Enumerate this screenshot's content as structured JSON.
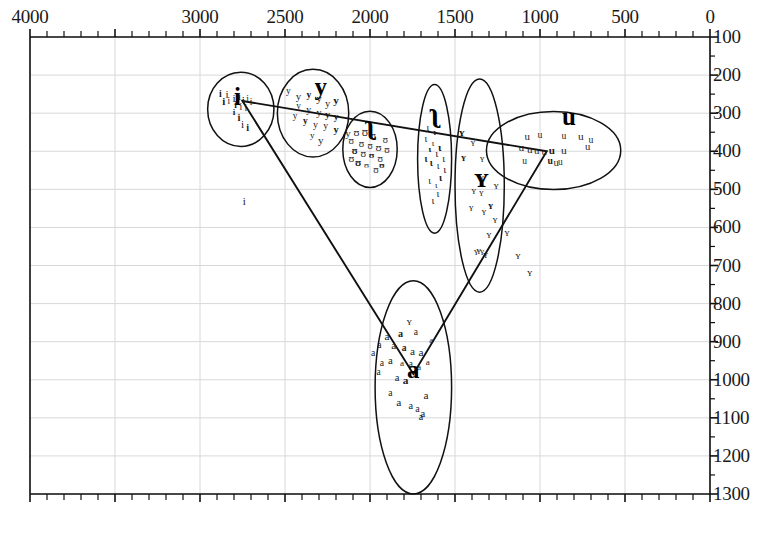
{
  "figure": {
    "kind": "vowel-formant-scatter",
    "background": "#ffffff",
    "ink": "#111111",
    "gridline_color": "#d8d8dc"
  },
  "axes": {
    "top": {
      "name": "F2 (Hz)",
      "orientation": "horizontal-reversed",
      "range_left": 4000,
      "range_right": 0,
      "labels": [
        "4000",
        "3000",
        "2500",
        "2000",
        "1500",
        "1000",
        "500",
        "0"
      ],
      "label_values": [
        4000,
        3000,
        2500,
        2000,
        1500,
        1000,
        500,
        0
      ],
      "minor_tick_step": 100
    },
    "right": {
      "name": "F1 (Hz)",
      "orientation": "vertical-down",
      "range_top": 100,
      "range_bottom": 1300,
      "labels": [
        "100",
        "200",
        "300",
        "400",
        "500",
        "600",
        "700",
        "800",
        "900",
        "1000",
        "1100",
        "1200",
        "1300"
      ],
      "label_values": [
        100,
        200,
        300,
        400,
        500,
        600,
        700,
        800,
        900,
        1000,
        1100,
        1200,
        1300
      ],
      "minor_tick_step": 50
    }
  },
  "chart_data": {
    "type": "scatter",
    "title": "",
    "xlabel": "F2 (Hz)",
    "ylabel": "F1 (Hz)",
    "xlim": [
      4000,
      0
    ],
    "ylim": [
      1300,
      100
    ],
    "x_reversed": true,
    "y_reversed": true,
    "grid": true,
    "legend": "none",
    "annotations": [
      {
        "label": "i",
        "x": 2780,
        "y": 258
      },
      {
        "label": "y",
        "x": 2290,
        "y": 230
      },
      {
        "label": "ʉ",
        "x": 2000,
        "y": 330
      },
      {
        "label": "ɪ",
        "x": 1620,
        "y": 300
      },
      {
        "label": "ʏ",
        "x": 1345,
        "y": 470
      },
      {
        "label": "u",
        "x": 830,
        "y": 310
      },
      {
        "label": "a",
        "x": 1745,
        "y": 975
      }
    ],
    "clusters": [
      {
        "name": "i",
        "shape": "ellipse",
        "center_x": 2760,
        "center_y": 290,
        "width_hz": 390,
        "height_hz": 195,
        "rotation_deg": 0,
        "points": [
          [
            2880,
            250
          ],
          [
            2840,
            252
          ],
          [
            2800,
            262
          ],
          [
            2770,
            258
          ],
          [
            2745,
            268
          ],
          [
            2720,
            262
          ],
          [
            2700,
            272
          ],
          [
            2790,
            282
          ],
          [
            2760,
            285
          ],
          [
            2730,
            290
          ],
          [
            2800,
            300
          ],
          [
            2770,
            312
          ],
          [
            2750,
            330
          ],
          [
            2720,
            340
          ],
          [
            2830,
            270
          ],
          [
            2860,
            268
          ]
        ]
      },
      {
        "name": "y",
        "shape": "ellipse",
        "center_x": 2335,
        "center_y": 300,
        "width_hz": 420,
        "height_hz": 230,
        "rotation_deg": 0,
        "points": [
          [
            2480,
            245
          ],
          [
            2420,
            255
          ],
          [
            2360,
            252
          ],
          [
            2300,
            262
          ],
          [
            2250,
            275
          ],
          [
            2200,
            268
          ],
          [
            2420,
            285
          ],
          [
            2360,
            292
          ],
          [
            2300,
            298
          ],
          [
            2250,
            305
          ],
          [
            2200,
            312
          ],
          [
            2440,
            310
          ],
          [
            2380,
            322
          ],
          [
            2320,
            330
          ],
          [
            2260,
            335
          ],
          [
            2200,
            345
          ],
          [
            2340,
            360
          ],
          [
            2290,
            372
          ]
        ]
      },
      {
        "name": "ʉ",
        "shape": "ellipse",
        "center_x": 2000,
        "center_y": 395,
        "width_hz": 320,
        "height_hz": 200,
        "rotation_deg": 0,
        "points": [
          [
            2080,
            350
          ],
          [
            2030,
            352
          ],
          [
            1980,
            362
          ],
          [
            2110,
            372
          ],
          [
            2050,
            382
          ],
          [
            2000,
            388
          ],
          [
            1950,
            392
          ],
          [
            1900,
            398
          ],
          [
            2090,
            402
          ],
          [
            2040,
            408
          ],
          [
            1990,
            412
          ],
          [
            1940,
            420
          ],
          [
            2070,
            432
          ],
          [
            2020,
            440
          ],
          [
            1965,
            448
          ],
          [
            2110,
            420
          ],
          [
            1910,
            372
          ],
          [
            1930,
            440
          ]
        ]
      },
      {
        "name": "ɪ",
        "shape": "ellipse",
        "center_x": 1620,
        "center_y": 420,
        "width_hz": 200,
        "height_hz": 390,
        "rotation_deg": 0,
        "points": [
          [
            1660,
            340
          ],
          [
            1620,
            352
          ],
          [
            1672,
            368
          ],
          [
            1630,
            382
          ],
          [
            1590,
            392
          ],
          [
            1648,
            398
          ],
          [
            1608,
            408
          ],
          [
            1566,
            418
          ],
          [
            1640,
            430
          ],
          [
            1600,
            440
          ],
          [
            1560,
            448
          ],
          [
            1650,
            478
          ],
          [
            1610,
            490
          ],
          [
            1600,
            512
          ],
          [
            1630,
            530
          ],
          [
            1585,
            470
          ],
          [
            1670,
            420
          ]
        ]
      },
      {
        "name": "ʏ",
        "shape": "ellipse",
        "center_x": 1355,
        "center_y": 490,
        "width_hz": 290,
        "height_hz": 560,
        "rotation_deg": 0,
        "points": [
          [
            1460,
            352
          ],
          [
            1395,
            378
          ],
          [
            1340,
            420
          ],
          [
            1345,
            468
          ],
          [
            1390,
            505
          ],
          [
            1345,
            512
          ],
          [
            1290,
            545
          ],
          [
            1330,
            560
          ],
          [
            1405,
            548
          ],
          [
            1265,
            580
          ],
          [
            1450,
            420
          ],
          [
            1300,
            618
          ],
          [
            1360,
            662
          ],
          [
            1340,
            668
          ],
          [
            1320,
            672
          ],
          [
            1375,
            665
          ],
          [
            1258,
            488
          ]
        ]
      },
      {
        "name": "u",
        "shape": "ellipse",
        "center_x": 920,
        "center_y": 398,
        "width_hz": 790,
        "height_hz": 205,
        "rotation_deg": 0,
        "points": [
          [
            1075,
            360
          ],
          [
            1000,
            358
          ],
          [
            860,
            360
          ],
          [
            760,
            362
          ],
          [
            700,
            370
          ],
          [
            1110,
            392
          ],
          [
            1060,
            398
          ],
          [
            1020,
            398
          ],
          [
            975,
            402
          ],
          [
            930,
            400
          ],
          [
            860,
            400
          ],
          [
            720,
            388
          ],
          [
            940,
            425
          ],
          [
            905,
            430
          ],
          [
            880,
            432
          ],
          [
            1090,
            428
          ]
        ]
      },
      {
        "name": "a",
        "shape": "ellipse",
        "center_x": 1745,
        "center_y": 1020,
        "width_hz": 450,
        "height_hz": 560,
        "rotation_deg": 0,
        "points": [
          [
            1820,
            880
          ],
          [
            1730,
            878
          ],
          [
            1640,
            898
          ],
          [
            1900,
            888
          ],
          [
            1860,
            912
          ],
          [
            1800,
            918
          ],
          [
            1750,
            928
          ],
          [
            1700,
            930
          ],
          [
            1945,
            910
          ],
          [
            1880,
            948
          ],
          [
            1812,
            958
          ],
          [
            1760,
            962
          ],
          [
            1712,
            968
          ],
          [
            1660,
            955
          ],
          [
            1930,
            955
          ],
          [
            1982,
            930
          ],
          [
            1840,
            995
          ],
          [
            1790,
            1002
          ],
          [
            1880,
            1035
          ],
          [
            1830,
            1060
          ],
          [
            1760,
            1068
          ],
          [
            1720,
            1078
          ],
          [
            1690,
            1090
          ],
          [
            1700,
            1098
          ],
          [
            1670,
            1042
          ],
          [
            1950,
            982
          ]
        ]
      }
    ],
    "stray_points": [
      {
        "label": "i",
        "x": 2740,
        "y": 530
      },
      {
        "label": "ʏ",
        "x": 1195,
        "y": 612
      },
      {
        "label": "ʏ",
        "x": 1130,
        "y": 672
      },
      {
        "label": "ʏ",
        "x": 1060,
        "y": 718
      },
      {
        "label": "ʏ",
        "x": 1770,
        "y": 845
      },
      {
        "label": "y",
        "x": 2130,
        "y": 352
      }
    ],
    "triangle": {
      "description": "vowel-space triangle connecting i, u and a corner means",
      "vertices": [
        {
          "label": "i",
          "x": 2750,
          "y": 268
        },
        {
          "label": "u",
          "x": 960,
          "y": 400
        },
        {
          "label": "a",
          "x": 1745,
          "y": 985
        }
      ]
    }
  }
}
